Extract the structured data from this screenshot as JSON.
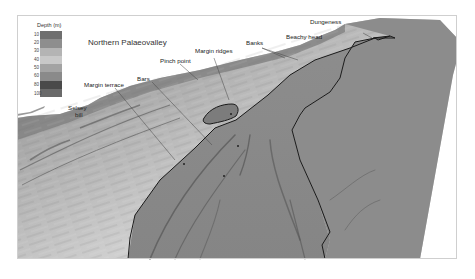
{
  "figure": {
    "title": "Northern Palaeovalley",
    "legend": {
      "title": "Depth (m)",
      "ticks": [
        "10",
        "20",
        "30",
        "40",
        "50",
        "60",
        "80",
        "100"
      ],
      "colors": [
        "#6f6f6f",
        "#8e8e8e",
        "#b4b4b4",
        "#c8c8c8",
        "#a3a3a3",
        "#8a8a8a",
        "#4a4a4a",
        "#6a6a6a"
      ]
    },
    "annotations": {
      "margin_terrace": "Margin terrace",
      "bars": "Bars",
      "pinch_point": "Pinch point",
      "margin_ridges": "Margin ridges",
      "banks": "Banks",
      "beachy_head": "Beachy head",
      "dungeness": "Dungeness",
      "selsey_bill_line1": "Selsey",
      "selsey_bill_line2": "bill"
    },
    "colors": {
      "land": "#ffffff",
      "shelf_light": "#c9c9c9",
      "shelf_mid": "#a9a9a9",
      "valley_floor": "#8f8f8f",
      "valley_outline": "#1a1a1a"
    }
  }
}
